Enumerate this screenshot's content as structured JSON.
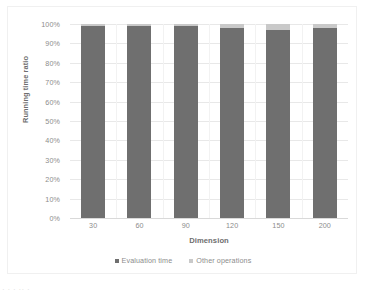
{
  "chart_data": {
    "type": "bar",
    "subtype": "100% stacked column",
    "title": "",
    "xlabel": "Dimension",
    "ylabel": "Running time ratio",
    "categories": [
      "30",
      "60",
      "90",
      "120",
      "150",
      "200"
    ],
    "ylim": [
      0,
      100
    ],
    "ytick_labels": [
      "100%",
      "90%",
      "80%",
      "70%",
      "60%",
      "50%",
      "40%",
      "30%",
      "20%",
      "10%",
      "0%"
    ],
    "ytick_values": [
      100,
      90,
      80,
      70,
      60,
      50,
      40,
      30,
      20,
      10,
      0
    ],
    "grid": "horizontal",
    "legend_position": "bottom-center",
    "series": [
      {
        "name": "Evaluation time",
        "color": "#6f6f6f",
        "values": [
          99,
          99,
          99,
          98,
          97,
          98
        ]
      },
      {
        "name": "Other operations",
        "color": "#c9c9c9",
        "values": [
          1,
          1,
          1,
          2,
          3,
          2
        ]
      }
    ]
  },
  "legend": {
    "items": [
      {
        "label": "Evaluation time",
        "color": "#6f6f6f",
        "marker": "square-marker"
      },
      {
        "label": "Other operations",
        "color": "#c9c9c9",
        "marker": "square-marker"
      }
    ]
  },
  "caption_fragment": "· ·  ·   ·· ·"
}
